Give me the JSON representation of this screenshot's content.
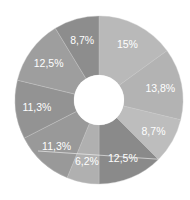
{
  "chart_data": {
    "type": "pie",
    "variant": "donut",
    "title": "",
    "legend": [],
    "start_angle_deg": 0,
    "direction": "clockwise",
    "center": [
      99,
      100
    ],
    "outer_radius": 84,
    "inner_radius": 25,
    "slices": [
      {
        "label": "15%",
        "value": 15.0,
        "color": "#b9b9b9"
      },
      {
        "label": "13,8%",
        "value": 13.8,
        "color": "#b3b3b3"
      },
      {
        "label": "8,7%",
        "value": 8.7,
        "color": "#bdbdbd"
      },
      {
        "label": "12,5%",
        "value": 12.5,
        "color": "#8a8a8a"
      },
      {
        "label": "6,2%",
        "value": 6.2,
        "color": "#b0b0b0"
      },
      {
        "label": "11,3%",
        "value": 11.3,
        "color": "#999999"
      },
      {
        "label": "11,3%",
        "value": 11.3,
        "color": "#939393"
      },
      {
        "label": "12,5%",
        "value": 12.5,
        "color": "#9e9e9e"
      },
      {
        "label": "8,7%",
        "value": 8.7,
        "color": "#8d8d8d"
      }
    ],
    "label_color": "#ffffff",
    "background": "#ffffff",
    "hole_color": "#ffffff"
  }
}
